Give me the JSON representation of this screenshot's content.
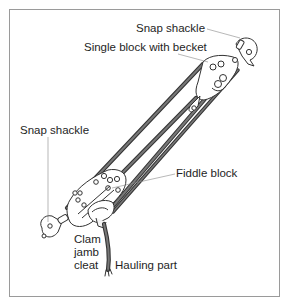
{
  "diagram": {
    "colors": {
      "frame": "#9a9a9a",
      "rope": "#5a5a5a",
      "outline": "#333333",
      "leader": "#888888",
      "text": "#1e1e1e"
    },
    "labels": {
      "snap_shackle_top": "Snap shackle",
      "single_block": "Single block with becket",
      "snap_shackle_left": "Snap shackle",
      "fiddle_block": "Fiddle block",
      "cleat_line1": "Clam",
      "cleat_line2": "jamb",
      "cleat_line3": "cleat",
      "hauling_part": "Hauling part"
    }
  }
}
